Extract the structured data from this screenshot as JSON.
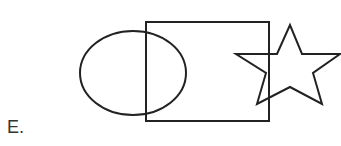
{
  "option_label": "E.",
  "stroke_color": "#222222",
  "shapes": [
    {
      "type": "ellipse",
      "cx": 133,
      "cy": 73,
      "rx": 53,
      "ry": 42
    },
    {
      "type": "rectangle",
      "x": 146,
      "y": 22,
      "width": 123,
      "height": 99
    },
    {
      "type": "star",
      "points": "290,25 277,54 236,54 266,73 257,104 290,87 322,104 313,73 340,54 302,54"
    }
  ]
}
